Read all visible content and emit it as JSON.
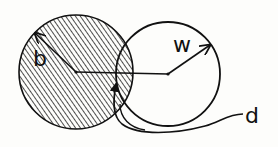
{
  "diagram": {
    "labels": {
      "b": "b",
      "w": "w",
      "d": "d"
    },
    "colors": {
      "background": "#fdfdfb",
      "stroke": "#111111",
      "hatch": "#222222"
    },
    "shapes": {
      "shaded_circle": {
        "label": "b",
        "description": "hatched circle of radius b"
      },
      "white_circle": {
        "label": "w",
        "description": "open circle of radius w"
      },
      "center_line": {
        "label": "d",
        "description": "distance d between centers"
      }
    }
  }
}
